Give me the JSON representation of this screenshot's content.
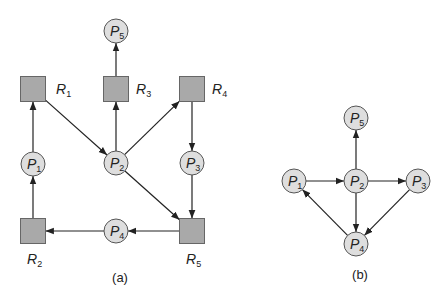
{
  "colors": {
    "process_fill": "#dedede",
    "process_stroke": "#555555",
    "resource_fill": "#a9a9a9",
    "resource_stroke": "#666666",
    "edge": "#222222",
    "text": "#222222"
  },
  "diagrams": [
    {
      "id": "a",
      "caption": "(a)",
      "caption_pos": [
        120,
        282
      ],
      "title": "Resource-allocation graph",
      "nodes": [
        {
          "id": "P5",
          "type": "process",
          "letter": "P",
          "sub": "5",
          "x": 116,
          "y": 31
        },
        {
          "id": "R1",
          "type": "resource",
          "letter": "R",
          "sub": "1",
          "x": 33,
          "y": 89,
          "label_pos": [
            56,
            94
          ]
        },
        {
          "id": "R3",
          "type": "resource",
          "letter": "R",
          "sub": "3",
          "x": 116,
          "y": 89,
          "label_pos": [
            136,
            94
          ]
        },
        {
          "id": "R4",
          "type": "resource",
          "letter": "R",
          "sub": "4",
          "x": 192,
          "y": 89,
          "label_pos": [
            212,
            94
          ]
        },
        {
          "id": "P1",
          "type": "process",
          "letter": "P",
          "sub": "1",
          "x": 33,
          "y": 164
        },
        {
          "id": "P2",
          "type": "process",
          "letter": "P",
          "sub": "2",
          "x": 116,
          "y": 163
        },
        {
          "id": "P3",
          "type": "process",
          "letter": "P",
          "sub": "3",
          "x": 192,
          "y": 163
        },
        {
          "id": "R2",
          "type": "resource",
          "letter": "R",
          "sub": "2",
          "x": 33,
          "y": 231,
          "label_pos": [
            27,
            264
          ]
        },
        {
          "id": "P4",
          "type": "process",
          "letter": "P",
          "sub": "4",
          "x": 116,
          "y": 231
        },
        {
          "id": "R5",
          "type": "resource",
          "letter": "R",
          "sub": "5",
          "x": 192,
          "y": 231,
          "label_pos": [
            186,
            264
          ]
        }
      ],
      "edges": [
        {
          "from": "R3",
          "to": "P5"
        },
        {
          "from": "P1",
          "to": "R1"
        },
        {
          "from": "R1",
          "to": "P2"
        },
        {
          "from": "P2",
          "to": "R3"
        },
        {
          "from": "P2",
          "to": "R4"
        },
        {
          "from": "R4",
          "to": "P3"
        },
        {
          "from": "P2",
          "to": "R5"
        },
        {
          "from": "P3",
          "to": "R5"
        },
        {
          "from": "R5",
          "to": "P4"
        },
        {
          "from": "P4",
          "to": "R2"
        },
        {
          "from": "R2",
          "to": "P1"
        }
      ]
    },
    {
      "id": "b",
      "caption": "(b)",
      "caption_pos": [
        360,
        279
      ],
      "title": "Corresponding wait-for graph",
      "nodes": [
        {
          "id": "P5",
          "type": "process",
          "letter": "P",
          "sub": "5",
          "x": 356,
          "y": 118
        },
        {
          "id": "P1",
          "type": "process",
          "letter": "P",
          "sub": "1",
          "x": 294,
          "y": 181
        },
        {
          "id": "P2",
          "type": "process",
          "letter": "P",
          "sub": "2",
          "x": 356,
          "y": 181
        },
        {
          "id": "P3",
          "type": "process",
          "letter": "P",
          "sub": "3",
          "x": 418,
          "y": 181
        },
        {
          "id": "P4",
          "type": "process",
          "letter": "P",
          "sub": "4",
          "x": 356,
          "y": 244
        }
      ],
      "edges": [
        {
          "from": "P2",
          "to": "P5"
        },
        {
          "from": "P1",
          "to": "P2"
        },
        {
          "from": "P2",
          "to": "P3"
        },
        {
          "from": "P2",
          "to": "P4"
        },
        {
          "from": "P3",
          "to": "P4"
        },
        {
          "from": "P4",
          "to": "P1"
        }
      ]
    }
  ]
}
